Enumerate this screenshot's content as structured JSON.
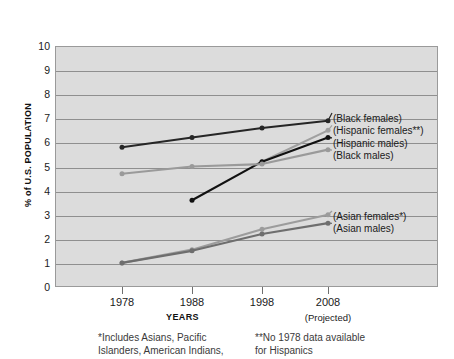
{
  "chart_data": {
    "type": "line",
    "title": "",
    "xlabel": "YEARS",
    "ylabel": "% of U.S. POPULATION",
    "x": [
      1978,
      1988,
      1998,
      2008
    ],
    "xtick_labels": [
      "1978",
      "1988",
      "1998",
      "2008"
    ],
    "x_extra_label": "(Projected)",
    "ytick_labels": [
      "0",
      "1",
      "2",
      "3",
      "4",
      "5",
      "6",
      "7",
      "8",
      "9",
      "10"
    ],
    "ylim": [
      0,
      10
    ],
    "grid": true,
    "legend_position": "right-inside",
    "series": [
      {
        "name": "(Black females)",
        "color": "#262626",
        "values": [
          5.8,
          6.2,
          6.6,
          6.9
        ]
      },
      {
        "name": "(Hispanic females**)",
        "color": "#a0a0a0",
        "values": [
          null,
          null,
          5.2,
          6.5
        ]
      },
      {
        "name": "(Hispanic males)",
        "color": "#111111",
        "values": [
          null,
          3.6,
          5.2,
          6.2
        ]
      },
      {
        "name": "(Black males)",
        "color": "#9a9a9a",
        "values": [
          4.7,
          5.0,
          5.1,
          5.7
        ]
      },
      {
        "name": "(Asian females*)",
        "color": "#9c9c9c",
        "values": [
          1.0,
          1.55,
          2.4,
          3.0
        ]
      },
      {
        "name": "(Asian males)",
        "color": "#6e6e6e",
        "values": [
          1.0,
          1.5,
          2.2,
          2.65
        ]
      }
    ],
    "annotations": {
      "footnote_left": "*Includes Asians, Pacific\nIslanders, American Indians,",
      "footnote_right": "**No 1978 data available\n   for Hispanics"
    }
  },
  "legend": {
    "top_group": [
      "(Black females)",
      "(Hispanic females**)",
      "(Hispanic males)",
      "(Black males)"
    ],
    "bottom_group": [
      "(Asian females*)",
      "(Asian males)"
    ]
  },
  "colors": {
    "plot_background": "#dcdcdc",
    "gridline": "#8f8f8f",
    "border": "#9a9a9a",
    "text": "#1a1a1a"
  }
}
